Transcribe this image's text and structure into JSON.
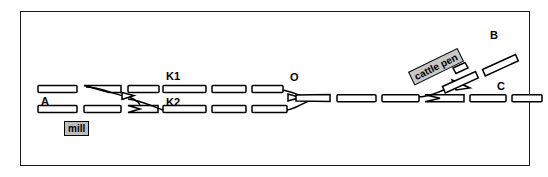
{
  "figure": {
    "type": "railway-track-schematic",
    "title_visible": false,
    "frame": {
      "x": 20,
      "y": 11,
      "width": 510,
      "height": 155,
      "border_color": "#1a1a1a",
      "background": "#ffffff"
    },
    "stroke_color": "#000000",
    "fill_color": "#ffffff"
  },
  "node_labels": [
    {
      "id": "A",
      "text": "A",
      "x": 41,
      "y": 95,
      "anchor": "left-track-start"
    },
    {
      "id": "K1",
      "text": "K1",
      "x": 166,
      "y": 70,
      "anchor": "upper-track-siding"
    },
    {
      "id": "K2",
      "text": "K2",
      "x": 166,
      "y": 97,
      "anchor": "lower-track-siding"
    },
    {
      "id": "O",
      "text": "O",
      "x": 290,
      "y": 72,
      "anchor": "junction-merge"
    },
    {
      "id": "B",
      "text": "B",
      "x": 490,
      "y": 30,
      "anchor": "upper-right-branch-end"
    },
    {
      "id": "C",
      "text": "C",
      "x": 497,
      "y": 81,
      "anchor": "lower-right-track-end"
    }
  ],
  "facility_labels": [
    {
      "id": "mill",
      "text": "mill",
      "x": 64,
      "y": 122,
      "rotation_deg": 0,
      "background": "#bdbdbd",
      "border": "#000000"
    },
    {
      "id": "cattle-pen",
      "text": "cattle pen",
      "x": 408,
      "y": 72,
      "rotation_deg": -26,
      "background": "#c7c7c7",
      "border": "#000000"
    }
  ],
  "tracks": {
    "upper_line_segments": [
      {
        "x1": 38,
        "y1": 89,
        "x2": 77,
        "y2": 89
      },
      {
        "x1": 84,
        "y1": 89,
        "x2": 121,
        "y2": 89
      },
      {
        "x1": 128,
        "y1": 89,
        "x2": 158,
        "y2": 89
      },
      {
        "x1": 163,
        "y1": 89,
        "x2": 205,
        "y2": 89
      },
      {
        "x1": 212,
        "y1": 89,
        "x2": 245,
        "y2": 89
      },
      {
        "x1": 252,
        "y1": 89,
        "x2": 283,
        "y2": 89
      }
    ],
    "lower_line_segments": [
      {
        "x1": 38,
        "y1": 109,
        "x2": 77,
        "y2": 109
      },
      {
        "x1": 84,
        "y1": 109,
        "x2": 121,
        "y2": 109
      },
      {
        "x1": 128,
        "y1": 109,
        "x2": 158,
        "y2": 109
      },
      {
        "x1": 163,
        "y1": 109,
        "x2": 205,
        "y2": 109
      },
      {
        "x1": 212,
        "y1": 109,
        "x2": 245,
        "y2": 109
      },
      {
        "x1": 252,
        "y1": 109,
        "x2": 287,
        "y2": 109
      }
    ],
    "main_line_segments": [
      {
        "x1": 306,
        "y1": 98,
        "x2": 345,
        "y2": 98
      },
      {
        "x1": 351,
        "y1": 98,
        "x2": 390,
        "y2": 98
      },
      {
        "x1": 396,
        "y1": 98,
        "x2": 435,
        "y2": 98
      },
      {
        "x1": 441,
        "y1": 98,
        "x2": 479,
        "y2": 98
      },
      {
        "x1": 485,
        "y1": 98,
        "x2": 516,
        "y2": 98
      }
    ],
    "branch_segments": [
      {
        "x1": 441,
        "y1": 82,
        "x2": 475,
        "y2": 66,
        "note": "cattle-pen-branch-lower"
      },
      {
        "x1": 481,
        "y1": 63,
        "x2": 515,
        "y2": 47,
        "note": "cattle-pen-branch-upper"
      }
    ],
    "switch_points": [
      "left-crossover",
      "O-merge",
      "cattle-pen-turnout"
    ]
  }
}
